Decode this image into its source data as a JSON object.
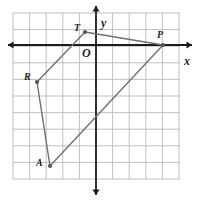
{
  "figure": {
    "kind": "coordinate-plane-quadrilateral",
    "background": "#ffffff",
    "grid": {
      "show": true,
      "color": "#b9b9bd",
      "cell_px": 16.6,
      "x_from_px": 13,
      "x_to_px": 180,
      "y_from_px": 13,
      "y_to_px": 179,
      "columns": 10,
      "rows": 10
    },
    "axes": {
      "color": "#1d1d1d",
      "origin_px": {
        "x": 96,
        "y": 45
      },
      "x_axis": {
        "label": "x",
        "label_px": {
          "x": 184,
          "y": 55
        },
        "from_px": 8,
        "to_px": 192,
        "arrows": "both"
      },
      "y_axis": {
        "label": "y",
        "label_px": {
          "x": 101,
          "y": 17
        },
        "from_px": 6,
        "to_px": 195,
        "arrows": "both"
      },
      "origin_label": {
        "text": "O",
        "px": {
          "x": 82,
          "y": 47
        }
      }
    },
    "shape": {
      "name": "TPAR",
      "stroke": "#6f6f75",
      "stroke_width": 1.4,
      "closed": true,
      "vertex_order": [
        "T",
        "P",
        "A",
        "R"
      ],
      "vertices": [
        {
          "label": "T",
          "px": {
            "x": 85,
            "y": 32
          },
          "unit": {
            "x": -0.7,
            "y": 0.8
          },
          "label_px": {
            "x": 74,
            "y": 23
          }
        },
        {
          "label": "P",
          "px": {
            "x": 163,
            "y": 45
          },
          "unit": {
            "x": 4.0,
            "y": 0.0
          },
          "label_px": {
            "x": 157,
            "y": 30
          }
        },
        {
          "label": "A",
          "px": {
            "x": 50,
            "y": 166
          },
          "unit": {
            "x": -2.8,
            "y": -7.3
          },
          "label_px": {
            "x": 36,
            "y": 158
          }
        },
        {
          "label": "R",
          "px": {
            "x": 37,
            "y": 82
          },
          "unit": {
            "x": -3.6,
            "y": -2.2
          },
          "label_px": {
            "x": 24,
            "y": 72
          }
        }
      ],
      "vertex_dot": {
        "radius_px": 2.1,
        "color": "#55555b"
      }
    }
  }
}
